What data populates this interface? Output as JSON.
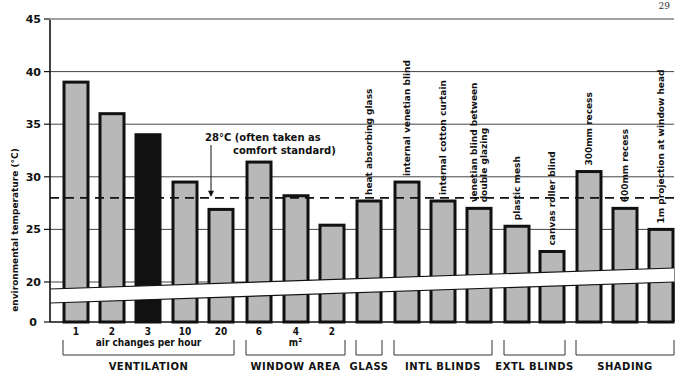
{
  "page_number": "29",
  "chart_data": {
    "type": "bar",
    "title": "",
    "ylabel": "environmental temperature (°C)",
    "xlabel": "",
    "ylim": [
      0,
      45
    ],
    "y_axis_break": [
      0,
      20
    ],
    "yticks": [
      0,
      20,
      25,
      30,
      35,
      40,
      45
    ],
    "grid": true,
    "reference_line": {
      "value": 28,
      "style": "dashed",
      "label_line1": "28°C (often taken as",
      "label_line2": "comfort standard)"
    },
    "groups": [
      {
        "name": "VENTILATION",
        "sublabel": "air changes per hour",
        "categories": [
          "1",
          "2",
          "3",
          "10",
          "20"
        ],
        "values": [
          39,
          36,
          34,
          29.5,
          26.9
        ],
        "highlight_index": 2
      },
      {
        "name": "WINDOW   AREA",
        "sublabel": "m²",
        "categories": [
          "6",
          "4",
          "2"
        ],
        "values": [
          31.4,
          28.2,
          25.4
        ]
      },
      {
        "name": "GLASS",
        "sublabel": "",
        "categories": [
          "heat absorbing glass"
        ],
        "values": [
          27.7
        ]
      },
      {
        "name": "INTL  BLINDS",
        "sublabel": "",
        "categories": [
          "internal venetian blind",
          "internal cotton curtain",
          "venetian blind between|double glazing"
        ],
        "values": [
          29.5,
          27.7,
          27.0
        ]
      },
      {
        "name": "EXTL  BLINDS",
        "sublabel": "",
        "categories": [
          "plastic mesh",
          "canvas roller blind"
        ],
        "values": [
          25.3,
          22.9
        ]
      },
      {
        "name": "SHADING",
        "sublabel": "",
        "categories": [
          "300mm recess",
          "600mm recess",
          "1m projection at window head"
        ],
        "values": [
          30.5,
          27.0,
          25.0
        ]
      }
    ],
    "colors": {
      "bar_fill": "#b8b8b8",
      "bar_stroke": "#111111",
      "highlight_fill": "#111111",
      "grid": "#444444"
    }
  }
}
